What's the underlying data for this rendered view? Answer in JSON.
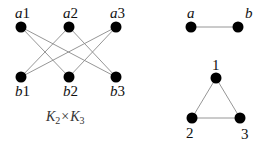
{
  "graphs": {
    "product": {
      "caption": {
        "k1": "K",
        "s1": "2",
        "times": "×",
        "k2": "K",
        "s2": "3"
      },
      "nodes": [
        {
          "id": "a1",
          "letter": "a",
          "index": "1"
        },
        {
          "id": "a2",
          "letter": "a",
          "index": "2"
        },
        {
          "id": "a3",
          "letter": "a",
          "index": "3"
        },
        {
          "id": "b1",
          "letter": "b",
          "index": "1"
        },
        {
          "id": "b2",
          "letter": "b",
          "index": "2"
        },
        {
          "id": "b3",
          "letter": "b",
          "index": "3"
        }
      ],
      "edges": [
        [
          "a1",
          "b2"
        ],
        [
          "a1",
          "b3"
        ],
        [
          "a2",
          "b1"
        ],
        [
          "a2",
          "b3"
        ],
        [
          "a3",
          "b1"
        ],
        [
          "a3",
          "b2"
        ]
      ]
    },
    "k2": {
      "nodes": [
        {
          "id": "a",
          "label": "a"
        },
        {
          "id": "b",
          "label": "b"
        }
      ],
      "edges": [
        [
          "a",
          "b"
        ]
      ]
    },
    "k3": {
      "nodes": [
        {
          "id": "1",
          "label": "1"
        },
        {
          "id": "2",
          "label": "2"
        },
        {
          "id": "3",
          "label": "3"
        }
      ],
      "edges": [
        [
          "1",
          "2"
        ],
        [
          "2",
          "3"
        ],
        [
          "1",
          "3"
        ]
      ]
    }
  }
}
